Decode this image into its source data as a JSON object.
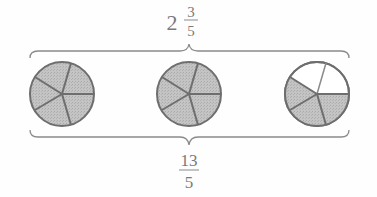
{
  "diagram": {
    "top_label": {
      "whole": "2",
      "numerator": "3",
      "denominator": "5"
    },
    "bottom_label": {
      "numerator": "13",
      "denominator": "5"
    },
    "circles": [
      {
        "name": "circle-1",
        "sectors": 5,
        "shaded": 5
      },
      {
        "name": "circle-2",
        "sectors": 5,
        "shaded": 5
      },
      {
        "name": "circle-3",
        "sectors": 5,
        "shaded": 3
      }
    ],
    "colors": {
      "shade": "#bdbdbd",
      "stroke": "#6e6e6e",
      "text": "#7a7a7a",
      "unshaded": "#ffffff"
    }
  }
}
